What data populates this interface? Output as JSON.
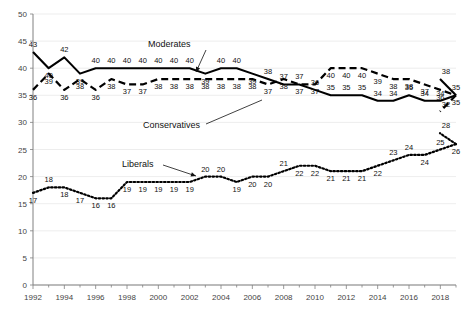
{
  "chart_data": {
    "type": "line",
    "title": "",
    "subtitle": "",
    "xlabel": "",
    "ylabel": "",
    "ylim": [
      0,
      50
    ],
    "ytick_step": 5,
    "yticks": [
      0,
      5,
      10,
      15,
      20,
      25,
      30,
      35,
      40,
      45,
      50
    ],
    "xlim": [
      1992,
      2019
    ],
    "xticks_major": [
      1992,
      1994,
      1996,
      1998,
      2000,
      2002,
      2004,
      2006,
      2008,
      2010,
      2012,
      2014,
      2016,
      2018
    ],
    "xticks_minor_every": 1,
    "grid": "horizontal",
    "legend_position": "inline-annotations",
    "x": [
      1992,
      1993,
      1994,
      1995,
      1996,
      1997,
      1998,
      1999,
      2000,
      2001,
      2002,
      2003,
      2004,
      2005,
      2006,
      2007,
      2008,
      2009,
      2010,
      2011,
      2012,
      2013,
      2014,
      2015,
      2016,
      2017,
      2018,
      2019
    ],
    "series": [
      {
        "name": "Moderates",
        "style": "solid",
        "color": "#000000",
        "values": [
          43,
          40,
          42,
          39,
          40,
          40,
          40,
          40,
          40,
          40,
          40,
          39,
          40,
          40,
          39,
          38,
          37,
          37,
          36,
          35,
          35,
          35,
          34,
          34,
          35,
          34,
          34,
          35
        ],
        "labels": [
          "43",
          "40",
          "42",
          "39",
          "40",
          "40",
          "40",
          "40",
          "40",
          "40",
          "40",
          "39",
          "40",
          "40",
          "39",
          "38",
          "37",
          "37",
          "36",
          "35",
          "35",
          "35",
          "34",
          "34",
          "35",
          "34",
          "34",
          "35"
        ],
        "end_label": "38"
      },
      {
        "name": "Conservatives",
        "style": "dashed",
        "color": "#000000",
        "values": [
          36,
          39,
          36,
          38,
          36,
          38,
          37,
          37,
          38,
          38,
          38,
          38,
          38,
          38,
          38,
          37,
          38,
          37,
          37,
          40,
          40,
          40,
          39,
          38,
          38,
          37,
          36,
          35
        ],
        "labels": [
          "36",
          "39",
          "36",
          "38",
          "36",
          "38",
          "37",
          "37",
          "38",
          "38",
          "38",
          "38",
          "38",
          "38",
          "38",
          "37",
          "38",
          "37",
          "37",
          "40",
          "40",
          "40",
          "39",
          "38",
          "38",
          "37",
          "36",
          "35"
        ],
        "end_label": "32"
      },
      {
        "name": "Liberals",
        "style": "dotted",
        "color": "#000000",
        "values": [
          17,
          18,
          18,
          17,
          16,
          16,
          19,
          19,
          19,
          19,
          19,
          20,
          20,
          19,
          20,
          20,
          21,
          22,
          22,
          21,
          21,
          21,
          22,
          23,
          24,
          24,
          25,
          26
        ],
        "labels": [
          "17",
          "18",
          "18",
          "17",
          "16",
          "16",
          "19",
          "19",
          "19",
          "19",
          "19",
          "20",
          "20",
          "19",
          "20",
          "20",
          "21",
          "22",
          "22",
          "21",
          "21",
          "21",
          "22",
          "23",
          "24",
          "24",
          "25",
          "26"
        ],
        "end_label": "28",
        "extra_label": "26"
      }
    ],
    "annotations": [
      {
        "text": "Moderates",
        "points_to_year": 2007
      },
      {
        "text": "Conservatives",
        "points_to_year": 2009
      },
      {
        "text": "Liberals",
        "points_to_year": 2003
      }
    ]
  }
}
